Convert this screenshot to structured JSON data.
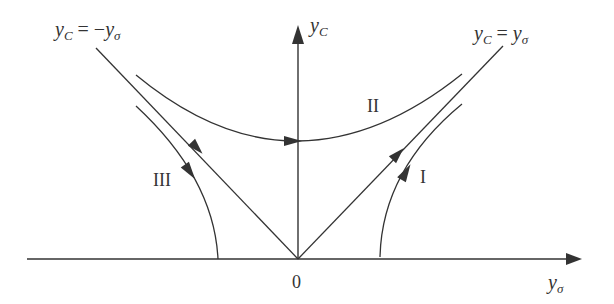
{
  "diagram": {
    "title": "",
    "axes": {
      "x_label": {
        "base": "y",
        "sub": "σ"
      },
      "y_label": {
        "base": "y",
        "sub": "C"
      },
      "origin_label": "0"
    },
    "lines": {
      "left": {
        "lhs_base": "y",
        "lhs_sub": "C",
        "eq": "=",
        "rhs_sign": "−",
        "rhs_base": "y",
        "rhs_sub": "σ"
      },
      "right": {
        "lhs_base": "y",
        "lhs_sub": "C",
        "eq": "=",
        "rhs_sign": "",
        "rhs_base": "y",
        "rhs_sub": "σ"
      }
    },
    "regions": {
      "I": "I",
      "II": "II",
      "III": "III"
    },
    "colors": {
      "stroke": "#333333",
      "background": "#ffffff"
    }
  }
}
